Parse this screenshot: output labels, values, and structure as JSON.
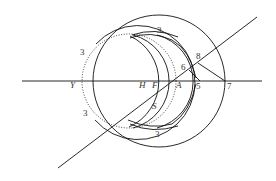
{
  "diagram": {
    "type": "geometric-construction",
    "line_color": "#111111",
    "labels": {
      "Y": "Y",
      "H": "H",
      "F": "F",
      "A": "A",
      "S": "S",
      "n3_left_top": "3",
      "n3_left_bottom": "3",
      "n3_top": "3",
      "n3_bottom": "3",
      "n5": "5",
      "n6": "6",
      "n7": "7",
      "n8": "8"
    }
  }
}
